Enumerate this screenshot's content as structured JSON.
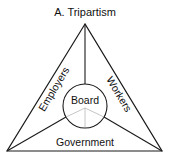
{
  "title": "A.  Tripartism",
  "labels": {
    "center": "Board",
    "left": "Employers",
    "right": "Workers",
    "bottom": "Government"
  },
  "colors": {
    "line": "#1a1a1a",
    "inner_line": "#b8b8b8",
    "background": "#ffffff"
  }
}
